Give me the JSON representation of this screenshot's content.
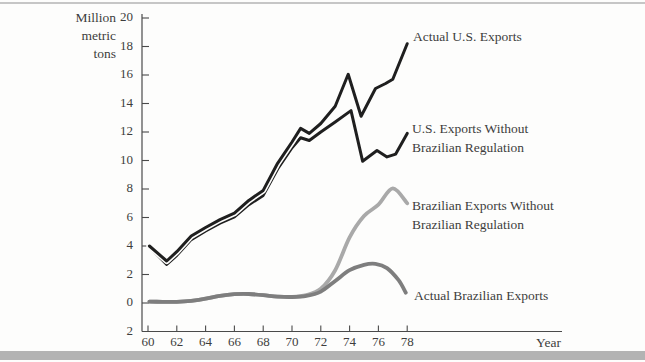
{
  "figure": {
    "background": "#fdfdfc",
    "top_rule_color": "#c6c6c6",
    "bottom_bar_color": "#b3b3b3",
    "axis_color": "#4a4a4a",
    "text_color": "#3d3d3d"
  },
  "chart": {
    "y_axis_title": "Million\nmetric\ntons",
    "x_axis_title": "Year",
    "y_corner_label": "2",
    "y_ticks": [
      {
        "label": "20",
        "value": 20
      },
      {
        "label": "18",
        "value": 18
      },
      {
        "label": "16",
        "value": 16
      },
      {
        "label": "14",
        "value": 14
      },
      {
        "label": "12",
        "value": 12
      },
      {
        "label": "10",
        "value": 10
      },
      {
        "label": "8",
        "value": 8
      },
      {
        "label": "6",
        "value": 6
      },
      {
        "label": "4",
        "value": 4
      },
      {
        "label": "2",
        "value": 2
      },
      {
        "label": "0",
        "value": 0
      }
    ],
    "x_ticks": [
      {
        "label": "60",
        "value": 60
      },
      {
        "label": "62",
        "value": 62
      },
      {
        "label": "64",
        "value": 64
      },
      {
        "label": "66",
        "value": 66
      },
      {
        "label": "68",
        "value": 68
      },
      {
        "label": "70",
        "value": 70
      },
      {
        "label": "72",
        "value": 72
      },
      {
        "label": "74",
        "value": 74
      },
      {
        "label": "76",
        "value": 76
      },
      {
        "label": "78",
        "value": 78
      }
    ]
  },
  "chart_data": {
    "type": "line",
    "title": "",
    "xlabel": "Year",
    "ylabel": "Million metric tons",
    "x_range": [
      60,
      78
    ],
    "y_range": [
      -2,
      20
    ],
    "grid": false,
    "legend": "inline-annotations",
    "series": [
      {
        "name": "Actual U.S. Exports",
        "label": "Actual U.S. Exports",
        "color": "#1f1f1f",
        "width": 3,
        "smooth": false,
        "points": [
          [
            60.1,
            4.0
          ],
          [
            61.3,
            2.95
          ],
          [
            62,
            3.6
          ],
          [
            63,
            4.7
          ],
          [
            64,
            5.3
          ],
          [
            65,
            5.85
          ],
          [
            66,
            6.3
          ],
          [
            67,
            7.2
          ],
          [
            68,
            7.9
          ],
          [
            69,
            9.8
          ],
          [
            70,
            11.3
          ],
          [
            70.6,
            12.25
          ],
          [
            71.2,
            11.9
          ],
          [
            72,
            12.6
          ],
          [
            73,
            13.8
          ],
          [
            73.9,
            16.05
          ],
          [
            74.8,
            13.1
          ],
          [
            75.8,
            15.05
          ],
          [
            76.5,
            15.4
          ],
          [
            77,
            15.7
          ],
          [
            78,
            18.2
          ]
        ]
      },
      {
        "name": "U.S. Exports Without Brazilian Regulation",
        "label": "U.S. Exports Without\nBrazilian Regulation",
        "color": "#1f1f1f",
        "width": 3,
        "smooth": false,
        "points": [
          [
            60.1,
            3.95
          ],
          [
            61.3,
            2.7
          ],
          [
            62,
            3.35
          ],
          [
            63,
            4.45
          ],
          [
            64,
            5.05
          ],
          [
            65,
            5.6
          ],
          [
            66,
            6.05
          ],
          [
            67,
            6.9
          ],
          [
            68,
            7.55
          ],
          [
            69,
            9.4
          ],
          [
            70,
            10.9
          ],
          [
            70.6,
            11.6
          ],
          [
            71.2,
            11.4
          ],
          [
            72,
            12.0
          ],
          [
            73,
            12.7
          ],
          [
            74.1,
            13.5
          ],
          [
            74.9,
            9.95
          ],
          [
            75.9,
            10.7
          ],
          [
            76.6,
            10.25
          ],
          [
            77.2,
            10.45
          ],
          [
            78,
            11.9
          ]
        ]
      },
      {
        "name": "Brazilian Exports Without Brazilian Regulation",
        "label": "Brazilian Exports Without\nBrazilian Regulation",
        "color": "#a9a9a9",
        "width": 3.8,
        "smooth": true,
        "points": [
          [
            60.1,
            0.1
          ],
          [
            61,
            0.08
          ],
          [
            62,
            0.08
          ],
          [
            63,
            0.15
          ],
          [
            64,
            0.3
          ],
          [
            65,
            0.5
          ],
          [
            66,
            0.62
          ],
          [
            67,
            0.63
          ],
          [
            68,
            0.55
          ],
          [
            69,
            0.45
          ],
          [
            70,
            0.42
          ],
          [
            71,
            0.55
          ],
          [
            72,
            1.0
          ],
          [
            73,
            2.3
          ],
          [
            74,
            4.6
          ],
          [
            75,
            6.1
          ],
          [
            76,
            6.9
          ],
          [
            77,
            8.05
          ],
          [
            78,
            7.0
          ]
        ]
      },
      {
        "name": "Actual Brazilian Exports",
        "label": "Actual Brazilian Exports",
        "color": "#7e7e7e",
        "width": 3.8,
        "smooth": true,
        "points": [
          [
            60.1,
            0.1
          ],
          [
            61,
            0.08
          ],
          [
            62,
            0.08
          ],
          [
            63,
            0.15
          ],
          [
            64,
            0.3
          ],
          [
            65,
            0.5
          ],
          [
            66,
            0.62
          ],
          [
            67,
            0.63
          ],
          [
            68,
            0.55
          ],
          [
            69,
            0.45
          ],
          [
            70,
            0.42
          ],
          [
            71,
            0.5
          ],
          [
            72,
            0.8
          ],
          [
            73,
            1.55
          ],
          [
            74,
            2.3
          ],
          [
            75,
            2.68
          ],
          [
            75.8,
            2.75
          ],
          [
            76.6,
            2.45
          ],
          [
            77.4,
            1.6
          ],
          [
            77.9,
            0.72
          ]
        ]
      }
    ]
  }
}
